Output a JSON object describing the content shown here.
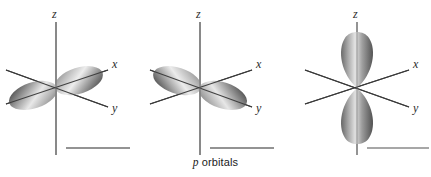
{
  "figure": {
    "caption_italic_symbol": "p",
    "caption_text": " orbitals",
    "background_color": "#ffffff",
    "axis_color": "#3a3a3a",
    "lobe_dark_color": "#5e5e5e",
    "lobe_light_color": "#d8d8d8",
    "scalebar_color": "#6f6f6f"
  },
  "panels": [
    {
      "id": "px",
      "name": "p-x-orbital",
      "orbital_label": "px",
      "axes": [
        {
          "name": "z",
          "label": "z"
        },
        {
          "name": "x",
          "label": "x"
        },
        {
          "name": "y",
          "label": "y"
        }
      ],
      "lobe_orientation": "along-x-axis",
      "lobe_count": 2,
      "scalebar": true
    },
    {
      "id": "py",
      "name": "p-y-orbital",
      "orbital_label": "py",
      "axes": [
        {
          "name": "z",
          "label": "z"
        },
        {
          "name": "x",
          "label": "x"
        },
        {
          "name": "y",
          "label": "y"
        }
      ],
      "lobe_orientation": "along-y-axis",
      "lobe_count": 2,
      "scalebar": true
    },
    {
      "id": "pz",
      "name": "p-z-orbital",
      "orbital_label": "pz",
      "axes": [
        {
          "name": "z",
          "label": "z"
        },
        {
          "name": "x",
          "label": "x"
        },
        {
          "name": "y",
          "label": "y"
        }
      ],
      "lobe_orientation": "along-z-axis",
      "lobe_count": 2,
      "scalebar": true
    }
  ]
}
